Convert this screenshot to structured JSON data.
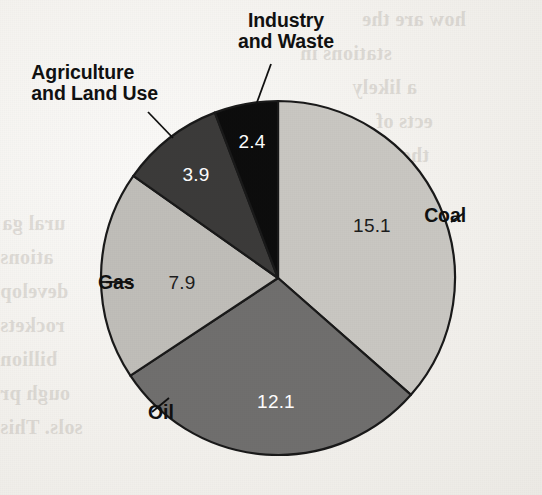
{
  "page": {
    "background_color": "#f3f1ed",
    "ghost_text": [
      {
        "text": "how are the",
        "x": 362,
        "y": 8,
        "size": 20
      },
      {
        "text": "stations in",
        "x": 300,
        "y": 42,
        "size": 20
      },
      {
        "text": "a likely",
        "x": 352,
        "y": 76,
        "size": 20
      },
      {
        "text": "ects of",
        "x": 376,
        "y": 110,
        "size": 20
      },
      {
        "text": "the world",
        "x": 344,
        "y": 144,
        "size": 20
      },
      {
        "text": "the",
        "x": 400,
        "y": 178,
        "size": 20
      },
      {
        "text": "ural ga",
        "x": 2,
        "y": 212,
        "size": 20
      },
      {
        "text": "ations",
        "x": 0,
        "y": 246,
        "size": 20
      },
      {
        "text": "develop",
        "x": 0,
        "y": 280,
        "size": 20
      },
      {
        "text": "rockets",
        "x": 0,
        "y": 314,
        "size": 20
      },
      {
        "text": "billion",
        "x": 0,
        "y": 348,
        "size": 20
      },
      {
        "text": "ough pr",
        "x": 0,
        "y": 382,
        "size": 20
      },
      {
        "text": "sols. This",
        "x": 0,
        "y": 416,
        "size": 20
      }
    ]
  },
  "chart_data": {
    "type": "pie",
    "title": "",
    "units": "",
    "center": {
      "x": 278,
      "y": 278
    },
    "radius": 177,
    "start_angle_deg": 0,
    "direction": "clockwise",
    "total": 41.4,
    "categories": [
      "Coal",
      "Oil",
      "Gas",
      "Agriculture and Land Use",
      "Industry and Waste"
    ],
    "values": [
      15.1,
      12.1,
      7.9,
      3.9,
      2.4
    ],
    "slices": [
      {
        "name": "Coal",
        "label": "Coal",
        "value": 15.1,
        "value_text": "15.1",
        "color": "#c9c7c2",
        "percent": 36.5,
        "start_deg": 0,
        "end_deg": 131.3,
        "value_x": 372,
        "value_y": 226,
        "value_contrast": "on-light",
        "label_x": 466,
        "label_y": 205,
        "label_align": "right",
        "leader": {
          "x1": 451,
          "y1": 222,
          "x2": 464,
          "y2": 213
        }
      },
      {
        "name": "Oil",
        "label": "Oil",
        "value": 12.1,
        "value_text": "12.1",
        "color": "#706f6e",
        "percent": 29.2,
        "start_deg": 131.3,
        "end_deg": 236.5,
        "value_x": 276,
        "value_y": 402,
        "value_contrast": "on-dark",
        "label_x": 148,
        "label_y": 402,
        "label_align": "left",
        "leader": {
          "x1": 169,
          "y1": 398,
          "x2": 152,
          "y2": 412
        }
      },
      {
        "name": "Gas",
        "label": "Gas",
        "value": 7.9,
        "value_text": "7.9",
        "color": "#c0beb9",
        "percent": 19.1,
        "start_deg": 236.5,
        "end_deg": 305.2,
        "value_x": 182,
        "value_y": 283,
        "value_contrast": "on-light",
        "label_x": 98,
        "label_y": 272,
        "label_align": "left",
        "leader": {
          "x1": 101,
          "y1": 282,
          "x2": 131,
          "y2": 282
        }
      },
      {
        "name": "Agriculture and Land Use",
        "label": "Agriculture\nand Land Use",
        "value": 3.9,
        "value_text": "3.9",
        "color": "#3c3b3a",
        "percent": 9.4,
        "start_deg": 305.2,
        "end_deg": 339.1,
        "value_x": 196,
        "value_y": 175,
        "value_contrast": "on-dark",
        "label_x": 158,
        "label_y": 62,
        "label_align": "right",
        "leader": {
          "x1": 173,
          "y1": 138,
          "x2": 148,
          "y2": 112
        }
      },
      {
        "name": "Industry and Waste",
        "label": "Industry\nand Waste",
        "value": 2.4,
        "value_text": "2.4",
        "color": "#0d0d0d",
        "percent": 5.8,
        "start_deg": 339.1,
        "end_deg": 360,
        "value_x": 252,
        "value_y": 142,
        "value_contrast": "on-dark",
        "label_x": 286,
        "label_y": 10,
        "label_align": "center",
        "leader": {
          "x1": 256,
          "y1": 105,
          "x2": 271,
          "y2": 64
        }
      }
    ]
  }
}
